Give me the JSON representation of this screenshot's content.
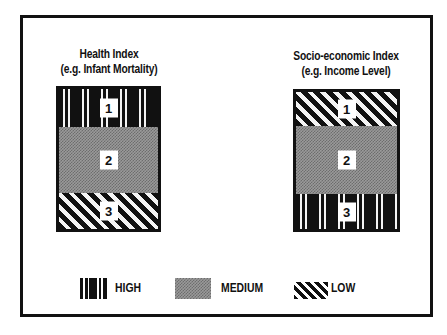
{
  "diagram": {
    "left_panel": {
      "title_line1": "Health Index",
      "title_line2": "(e.g. Infant Mortality)",
      "bands": [
        {
          "number": "1",
          "level": "HIGH"
        },
        {
          "number": "2",
          "level": "MEDIUM"
        },
        {
          "number": "3",
          "level": "LOW"
        }
      ]
    },
    "right_panel": {
      "title_line1": "Socio-economic Index",
      "title_line2": "(e.g. Income Level)",
      "bands": [
        {
          "number": "1",
          "level": "LOW"
        },
        {
          "number": "2",
          "level": "MEDIUM"
        },
        {
          "number": "3",
          "level": "HIGH"
        }
      ]
    },
    "legend": [
      {
        "label": "HIGH",
        "pattern": "vertical-bars"
      },
      {
        "label": "MEDIUM",
        "pattern": "stipple"
      },
      {
        "label": "LOW",
        "pattern": "diagonal-hatch"
      }
    ],
    "colors": {
      "ink": "#111111",
      "paper": "#ffffff",
      "medium_gray": "#9a9a9a"
    }
  }
}
